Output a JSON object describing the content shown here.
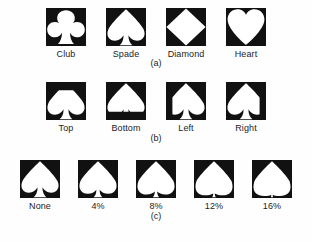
{
  "figure": {
    "background_color": "#fefefe",
    "tile_color": "#111111",
    "shape_color": "#ffffff",
    "text_color": "#1d1d1d",
    "panels": [
      {
        "caption": "(a)",
        "variation": "suit type",
        "items": [
          {
            "label": "Club",
            "icon": "club-cutout-icon"
          },
          {
            "label": "Spade",
            "icon": "spade-cutout-icon"
          },
          {
            "label": "Diamond",
            "icon": "diamond-cutout-icon"
          },
          {
            "label": "Heart",
            "icon": "heart-cutout-icon"
          }
        ]
      },
      {
        "caption": "(b)",
        "variation": "occlusion position",
        "items": [
          {
            "label": "Top",
            "icon": "spade-clipped-top-icon"
          },
          {
            "label": "Bottom",
            "icon": "spade-clipped-bottom-icon"
          },
          {
            "label": "Left",
            "icon": "spade-clipped-left-icon"
          },
          {
            "label": "Right",
            "icon": "spade-clipped-right-icon"
          }
        ]
      },
      {
        "caption": "(c)",
        "variation": "stem reduction",
        "items": [
          {
            "label": "None",
            "icon": "spade-stem-0-icon",
            "amount": 0
          },
          {
            "label": "4%",
            "icon": "spade-stem-4-icon",
            "amount": 4
          },
          {
            "label": "8%",
            "icon": "spade-stem-8-icon",
            "amount": 8
          },
          {
            "label": "12%",
            "icon": "spade-stem-12-icon",
            "amount": 12
          },
          {
            "label": "16%",
            "icon": "spade-stem-16-icon",
            "amount": 16
          }
        ]
      }
    ]
  }
}
